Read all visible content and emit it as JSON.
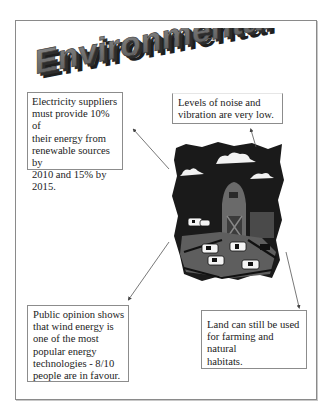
{
  "title": "Environmental",
  "illustration": {
    "subject": "farm-scene",
    "description": "Barn with cows in a fenced field under a dark sky with clouds"
  },
  "callouts": [
    {
      "id": "box1",
      "lines": [
        "Electricity suppliers",
        "must provide 10% of",
        "their energy from",
        "renewable sources by",
        "2010 and 15% by",
        "2015."
      ]
    },
    {
      "id": "box2",
      "lines": [
        "Levels of noise and",
        "vibration are very low."
      ]
    },
    {
      "id": "box3",
      "lines": [
        "Public opinion shows",
        "that wind energy is",
        "one of the most",
        "popular energy",
        "technologies - 8/10",
        "people are in favour."
      ]
    },
    {
      "id": "box4",
      "lines": [
        "Land can still be used",
        "for farming and natural",
        "habitats."
      ]
    }
  ],
  "colors": {
    "title_face": "#6e6e6e",
    "title_side": "#2a2a2a",
    "border": "#8a8a8a",
    "text": "#222222"
  }
}
